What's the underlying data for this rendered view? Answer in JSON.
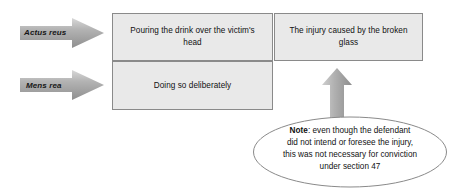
{
  "diagram": {
    "side_labels": [
      {
        "id": "actus-reus",
        "text": "Actus reus"
      },
      {
        "id": "mens-rea",
        "text": "Mens rea"
      }
    ],
    "boxes": [
      {
        "id": "actus-reus-box",
        "text": "Pouring the drink over the victim's head"
      },
      {
        "id": "mens-rea-box",
        "text": "Doing so deliberately"
      },
      {
        "id": "injury-box",
        "text": "The injury caused by the broken glass"
      }
    ],
    "arrows": [
      {
        "id": "arrow-actus-reus",
        "direction": "right"
      },
      {
        "id": "arrow-mens-rea",
        "direction": "right"
      },
      {
        "id": "arrow-note-to-injury",
        "direction": "up"
      }
    ],
    "note": {
      "label": "Note",
      "separator": ": ",
      "line1": "even though the defendant",
      "line2": "did not intend or foresee the injury,",
      "line3": "this was not necessary for conviction",
      "line4": "under section  47"
    },
    "colors": {
      "box_fill": "#e9e9e9",
      "box_border": "#8a8a8a",
      "arrow_fill": "#a6a6a6",
      "arrow_light": "#d4d4d4",
      "ellipse_border": "#8a8a8a",
      "text": "#111111",
      "page_background": "#ffffff"
    }
  }
}
